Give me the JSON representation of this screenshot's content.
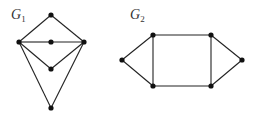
{
  "graphs": [
    {
      "name": "G1",
      "label": "G",
      "subscript": "1",
      "label_pos": [
        11,
        19
      ],
      "vertices": [
        {
          "id": "top",
          "x": 51,
          "y": 15
        },
        {
          "id": "left",
          "x": 19,
          "y": 42
        },
        {
          "id": "center",
          "x": 51,
          "y": 42
        },
        {
          "id": "right",
          "x": 84,
          "y": 42
        },
        {
          "id": "lower",
          "x": 51,
          "y": 69
        },
        {
          "id": "bottom",
          "x": 51,
          "y": 108
        }
      ],
      "edges": [
        [
          "top",
          "left"
        ],
        [
          "top",
          "right"
        ],
        [
          "left",
          "center"
        ],
        [
          "center",
          "right"
        ],
        [
          "left",
          "lower"
        ],
        [
          "lower",
          "right"
        ],
        [
          "left",
          "bottom"
        ],
        [
          "right",
          "bottom"
        ]
      ]
    },
    {
      "name": "G2",
      "label": "G",
      "subscript": "2",
      "label_pos": [
        130,
        19
      ],
      "vertices": [
        {
          "id": "left",
          "x": 122,
          "y": 60
        },
        {
          "id": "top_left",
          "x": 153,
          "y": 35
        },
        {
          "id": "top_right",
          "x": 211,
          "y": 35
        },
        {
          "id": "right",
          "x": 242,
          "y": 60
        },
        {
          "id": "bottom_left",
          "x": 153,
          "y": 86
        },
        {
          "id": "bottom_right",
          "x": 211,
          "y": 86
        }
      ],
      "edges": [
        [
          "left",
          "top_left"
        ],
        [
          "left",
          "bottom_left"
        ],
        [
          "top_left",
          "top_right"
        ],
        [
          "bottom_left",
          "bottom_right"
        ],
        [
          "top_left",
          "bottom_left"
        ],
        [
          "top_right",
          "bottom_right"
        ],
        [
          "top_right",
          "right"
        ],
        [
          "bottom_right",
          "right"
        ]
      ]
    }
  ],
  "style": {
    "edge_color": "#222222",
    "vertex_color": "#111111",
    "vertex_radius": 2.6
  }
}
